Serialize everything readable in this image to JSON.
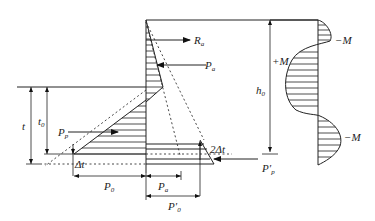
{
  "diagram": {
    "type": "retaining wall / sheet pile earth pressure and bending moment diagram",
    "labels": {
      "Ra": {
        "main": "R",
        "sub": "a"
      },
      "Pa_top": {
        "main": "P",
        "sub": "a"
      },
      "h0": {
        "main": "h",
        "sub": "0"
      },
      "plusM": "+M",
      "minusM_top": "−M",
      "minusM_bottom": "−M",
      "t": "t",
      "t0": {
        "main": "t",
        "sub": "0"
      },
      "Pp": {
        "main": "P",
        "sub": "p"
      },
      "delta_t": "Δt",
      "two_delta_t": "2Δt",
      "Pp_prime": {
        "main": "P′",
        "sub": "p"
      },
      "P0": {
        "main": "P",
        "sub": "0"
      },
      "Pa_dim": {
        "main": "P",
        "sub": "a"
      },
      "P0_prime": {
        "main": "P′",
        "sub": "0"
      }
    },
    "elements": [
      "wall",
      "ground-line",
      "active-pressure-triangle",
      "passive-pressure-triangle",
      "anchor-force-Ra",
      "active-resultant-Pa",
      "passive-resultant-Pp",
      "passive-resultant-Pp-prime",
      "dimension-h0",
      "dimension-t",
      "dimension-t0",
      "dimension-P0",
      "dimension-Pa",
      "dimension-P0-prime",
      "bending-moment-diagram"
    ]
  }
}
